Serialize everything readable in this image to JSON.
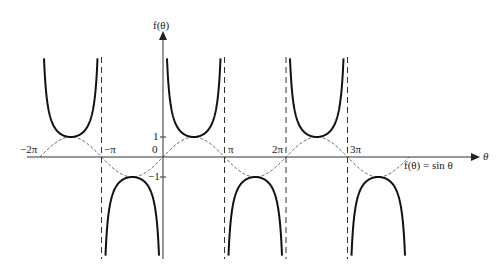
{
  "chart_data": {
    "type": "line",
    "title": "",
    "xlabel": "θ",
    "ylabel": "f(θ)",
    "x_ticks": [
      "−2π",
      "−π",
      "0",
      "π",
      "2π",
      "3π"
    ],
    "x_tick_values": [
      -6.2832,
      -3.1416,
      0,
      3.1416,
      6.2832,
      9.4248
    ],
    "y_ticks": [
      "1",
      "0",
      "−1"
    ],
    "y_tick_values": [
      1,
      0,
      -1
    ],
    "xlim": [
      -2.2,
      4.3
    ],
    "ylim": [
      -5,
      5
    ],
    "grid": false,
    "series": [
      {
        "name": "csc θ",
        "style": "solid-bold",
        "description": "cosecant branches with vertical asymptotes at multiples of π",
        "x": [
          "-3π/2",
          "-π/2",
          "π/2",
          "3π/2",
          "5π/2",
          "7π/2"
        ],
        "turning_values": [
          1,
          -1,
          1,
          -1,
          1,
          -1
        ]
      },
      {
        "name": "f(θ) = sin θ",
        "style": "dashed",
        "x_range": [
          "-2π",
          "4π"
        ],
        "x": [
          "-2π",
          "-3π/2",
          "-π",
          "-π/2",
          "0",
          "π/2",
          "π",
          "3π/2",
          "2π",
          "5π/2",
          "3π",
          "7π/2",
          "4π"
        ],
        "values": [
          0,
          1,
          0,
          -1,
          0,
          1,
          0,
          -1,
          0,
          1,
          0,
          -1,
          0
        ]
      }
    ],
    "asymptotes": [
      "-π",
      "π",
      "2π",
      "3π"
    ],
    "annotations": [
      "f(θ) = sin θ"
    ]
  },
  "labels": {
    "y_axis": "f(θ)",
    "x_axis": "θ",
    "tick_m2pi": "−2π",
    "tick_mpi": "−π",
    "tick_0": "0",
    "tick_pi": "π",
    "tick_2pi": "2π",
    "tick_3pi": "3π",
    "tick_1": "1",
    "tick_m1": "−1",
    "sine_label": "f(θ)  =  sin θ"
  }
}
